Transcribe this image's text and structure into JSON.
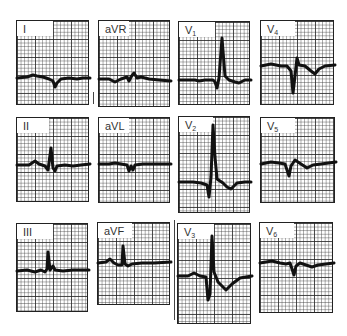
{
  "figure": {
    "layout": "3 rows x 4 columns",
    "line_color": "#111111",
    "grid_color": "#3c3c3c",
    "background": "#ffffff"
  },
  "leads": [
    {
      "id": "I",
      "label": "I",
      "sub": "",
      "x": 16,
      "y": 20,
      "w": 73,
      "h": 85,
      "lw": 36,
      "points": [
        [
          0,
          57
        ],
        [
          10,
          56
        ],
        [
          16,
          54
        ],
        [
          20,
          55
        ],
        [
          26,
          56
        ],
        [
          32,
          58
        ],
        [
          36,
          60
        ],
        [
          38,
          66
        ],
        [
          40,
          62
        ],
        [
          44,
          58
        ],
        [
          52,
          57
        ],
        [
          60,
          58
        ],
        [
          66,
          57
        ],
        [
          73,
          57
        ]
      ]
    },
    {
      "id": "aVR",
      "label": "aVR",
      "sub": "",
      "x": 98,
      "y": 20,
      "w": 72,
      "h": 87,
      "lw": 30,
      "points": [
        [
          0,
          58
        ],
        [
          10,
          58
        ],
        [
          16,
          61
        ],
        [
          22,
          58
        ],
        [
          28,
          56
        ],
        [
          30,
          60
        ],
        [
          32,
          56
        ],
        [
          35,
          52
        ],
        [
          38,
          57
        ],
        [
          42,
          56
        ],
        [
          50,
          58
        ],
        [
          60,
          59
        ],
        [
          72,
          60
        ]
      ]
    },
    {
      "id": "V1",
      "label": "V",
      "sub": "1",
      "x": 178,
      "y": 21,
      "w": 72,
      "h": 84,
      "lw": 36,
      "points": [
        [
          0,
          58
        ],
        [
          16,
          58
        ],
        [
          20,
          59
        ],
        [
          26,
          58
        ],
        [
          34,
          58
        ],
        [
          36,
          60
        ],
        [
          38,
          66
        ],
        [
          40,
          56
        ],
        [
          43,
          16
        ],
        [
          46,
          54
        ],
        [
          50,
          58
        ],
        [
          56,
          60
        ],
        [
          60,
          61
        ],
        [
          66,
          58
        ],
        [
          72,
          58
        ]
      ]
    },
    {
      "id": "V4",
      "label": "V",
      "sub": "4",
      "x": 260,
      "y": 20,
      "w": 74,
      "h": 85,
      "lw": 34,
      "points": [
        [
          0,
          45
        ],
        [
          10,
          43
        ],
        [
          20,
          45
        ],
        [
          26,
          45
        ],
        [
          30,
          50
        ],
        [
          32,
          72
        ],
        [
          34,
          55
        ],
        [
          36,
          37
        ],
        [
          38,
          44
        ],
        [
          44,
          45
        ],
        [
          50,
          50
        ],
        [
          54,
          53
        ],
        [
          58,
          48
        ],
        [
          64,
          45
        ],
        [
          74,
          44
        ]
      ]
    },
    {
      "id": "II",
      "label": "II",
      "sub": "",
      "x": 16,
      "y": 117,
      "w": 73,
      "h": 85,
      "lw": 32,
      "points": [
        [
          0,
          47
        ],
        [
          12,
          47
        ],
        [
          18,
          43
        ],
        [
          22,
          46
        ],
        [
          28,
          48
        ],
        [
          31,
          52
        ],
        [
          34,
          30
        ],
        [
          36,
          50
        ],
        [
          38,
          53
        ],
        [
          40,
          48
        ],
        [
          48,
          47
        ],
        [
          56,
          48
        ],
        [
          64,
          47
        ],
        [
          73,
          46
        ]
      ]
    },
    {
      "id": "aVL",
      "label": "aVL",
      "sub": "",
      "x": 98,
      "y": 117,
      "w": 72,
      "h": 86,
      "lw": 30,
      "points": [
        [
          0,
          46
        ],
        [
          10,
          46
        ],
        [
          16,
          45
        ],
        [
          22,
          46
        ],
        [
          28,
          47
        ],
        [
          30,
          53
        ],
        [
          32,
          48
        ],
        [
          34,
          52
        ],
        [
          36,
          47
        ],
        [
          44,
          46
        ],
        [
          56,
          46
        ],
        [
          66,
          46
        ],
        [
          72,
          46
        ]
      ]
    },
    {
      "id": "V2",
      "label": "V",
      "sub": "2",
      "x": 178,
      "y": 116,
      "w": 72,
      "h": 97,
      "lw": 34,
      "points": [
        [
          0,
          65
        ],
        [
          14,
          65
        ],
        [
          22,
          66
        ],
        [
          28,
          68
        ],
        [
          30,
          80
        ],
        [
          32,
          60
        ],
        [
          34,
          8
        ],
        [
          36,
          40
        ],
        [
          38,
          62
        ],
        [
          44,
          66
        ],
        [
          48,
          70
        ],
        [
          52,
          72
        ],
        [
          58,
          66
        ],
        [
          66,
          65
        ],
        [
          72,
          65
        ]
      ]
    },
    {
      "id": "V5",
      "label": "V",
      "sub": "5",
      "x": 260,
      "y": 117,
      "w": 75,
      "h": 86,
      "lw": 34,
      "points": [
        [
          0,
          46
        ],
        [
          10,
          44
        ],
        [
          18,
          45
        ],
        [
          24,
          46
        ],
        [
          26,
          52
        ],
        [
          28,
          58
        ],
        [
          30,
          48
        ],
        [
          34,
          42
        ],
        [
          40,
          46
        ],
        [
          46,
          50
        ],
        [
          52,
          47
        ],
        [
          60,
          46
        ],
        [
          75,
          44
        ]
      ]
    },
    {
      "id": "III",
      "label": "III",
      "sub": "",
      "x": 16,
      "y": 223,
      "w": 72,
      "h": 89,
      "lw": 36,
      "points": [
        [
          0,
          47
        ],
        [
          10,
          46
        ],
        [
          18,
          48
        ],
        [
          24,
          46
        ],
        [
          28,
          48
        ],
        [
          30,
          45
        ],
        [
          31,
          28
        ],
        [
          33,
          46
        ],
        [
          36,
          42
        ],
        [
          38,
          46
        ],
        [
          46,
          47
        ],
        [
          56,
          46
        ],
        [
          72,
          46
        ]
      ]
    },
    {
      "id": "aVF",
      "label": "aVF",
      "sub": "",
      "x": 97,
      "y": 222,
      "w": 73,
      "h": 83,
      "lw": 34,
      "points": [
        [
          0,
          40
        ],
        [
          8,
          39
        ],
        [
          12,
          36
        ],
        [
          16,
          40
        ],
        [
          20,
          42
        ],
        [
          24,
          42
        ],
        [
          25,
          23
        ],
        [
          27,
          41
        ],
        [
          30,
          43
        ],
        [
          34,
          41
        ],
        [
          44,
          40
        ],
        [
          56,
          40
        ],
        [
          73,
          39
        ]
      ]
    },
    {
      "id": "V3",
      "label": "V",
      "sub": "3",
      "x": 177,
      "y": 223,
      "w": 74,
      "h": 101,
      "lw": 36,
      "points": [
        [
          0,
          52
        ],
        [
          10,
          52
        ],
        [
          16,
          49
        ],
        [
          22,
          52
        ],
        [
          28,
          53
        ],
        [
          30,
          76
        ],
        [
          32,
          70
        ],
        [
          34,
          12
        ],
        [
          36,
          48
        ],
        [
          40,
          58
        ],
        [
          44,
          62
        ],
        [
          48,
          66
        ],
        [
          54,
          60
        ],
        [
          62,
          54
        ],
        [
          74,
          52
        ]
      ]
    },
    {
      "id": "V6",
      "label": "V",
      "sub": "6",
      "x": 259,
      "y": 222,
      "w": 74,
      "h": 91,
      "lw": 34,
      "points": [
        [
          0,
          40
        ],
        [
          12,
          38
        ],
        [
          20,
          40
        ],
        [
          26,
          41
        ],
        [
          30,
          40
        ],
        [
          32,
          46
        ],
        [
          34,
          52
        ],
        [
          36,
          43
        ],
        [
          40,
          40
        ],
        [
          46,
          42
        ],
        [
          52,
          44
        ],
        [
          58,
          42
        ],
        [
          66,
          41
        ],
        [
          74,
          40
        ]
      ]
    }
  ]
}
